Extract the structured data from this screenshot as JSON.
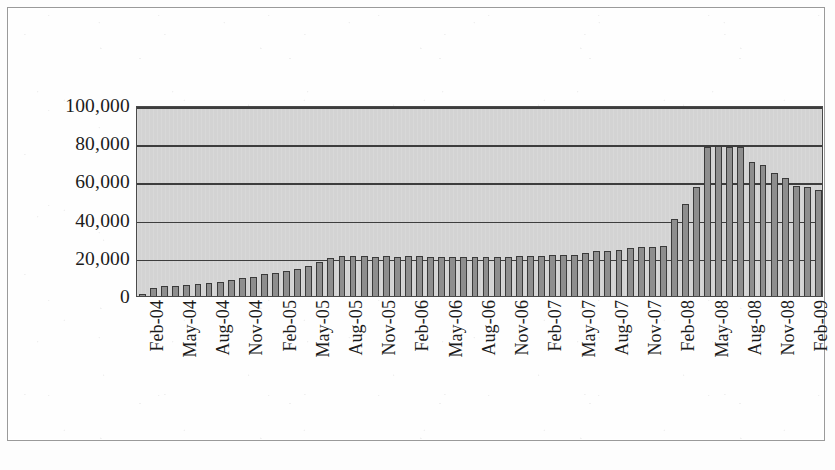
{
  "chart_data": {
    "type": "bar",
    "title": "",
    "subtitle": "",
    "xlabel": "",
    "ylabel": "",
    "ylim": [
      0,
      100000
    ],
    "ytick_labels": [
      "100,000",
      "80,000",
      "60,000",
      "40,000",
      "20,000",
      "0"
    ],
    "ytick_values": [
      100000,
      80000,
      60000,
      40000,
      20000,
      0
    ],
    "grid": true,
    "legend": "none",
    "xtick_labels": [
      "Feb-04",
      "May-04",
      "Aug-04",
      "Nov-04",
      "Feb-05",
      "May-05",
      "Aug-05",
      "Nov-05",
      "Feb-06",
      "May-06",
      "Aug-06",
      "Nov-06",
      "Feb-07",
      "May-07",
      "Aug-07",
      "Nov-07",
      "Feb-08",
      "May-08",
      "Aug-08",
      "Nov-08",
      "Feb-09"
    ],
    "xtick_indices": [
      0,
      3,
      6,
      9,
      12,
      15,
      18,
      21,
      24,
      27,
      30,
      33,
      36,
      39,
      42,
      45,
      48,
      51,
      54,
      57,
      60
    ],
    "categories": [
      "Feb-04",
      "Mar-04",
      "Apr-04",
      "May-04",
      "Jun-04",
      "Jul-04",
      "Aug-04",
      "Sep-04",
      "Oct-04",
      "Nov-04",
      "Dec-04",
      "Jan-05",
      "Feb-05",
      "Mar-05",
      "Apr-05",
      "May-05",
      "Jun-05",
      "Jul-05",
      "Aug-05",
      "Sep-05",
      "Oct-05",
      "Nov-05",
      "Dec-05",
      "Jan-06",
      "Feb-06",
      "Mar-06",
      "Apr-06",
      "May-06",
      "Jun-06",
      "Jul-06",
      "Aug-06",
      "Sep-06",
      "Oct-06",
      "Nov-06",
      "Dec-06",
      "Jan-07",
      "Feb-07",
      "Mar-07",
      "Apr-07",
      "May-07",
      "Jun-07",
      "Jul-07",
      "Aug-07",
      "Sep-07",
      "Oct-07",
      "Nov-07",
      "Dec-07",
      "Jan-08",
      "Feb-08",
      "Mar-08",
      "Apr-08",
      "May-08",
      "Jun-08",
      "Jul-08",
      "Aug-08",
      "Sep-08",
      "Oct-08",
      "Nov-08",
      "Dec-08",
      "Jan-09",
      "Feb-09",
      "Mar-09"
    ],
    "values": [
      1200,
      4200,
      5000,
      5200,
      6000,
      6200,
      7000,
      7200,
      8600,
      9600,
      10200,
      11600,
      12200,
      13000,
      14000,
      15600,
      17600,
      19800,
      20800,
      21000,
      21000,
      20600,
      20800,
      20600,
      21000,
      20800,
      20600,
      20600,
      20400,
      20400,
      20400,
      20600,
      20600,
      20600,
      20800,
      20800,
      21000,
      21600,
      21400,
      21600,
      22400,
      23400,
      23600,
      24200,
      25400,
      25600,
      25600,
      26000,
      40200,
      48000,
      57000,
      78000,
      78400,
      78200,
      78000,
      70400,
      68600,
      64200,
      61800,
      57400,
      57000,
      55600
    ],
    "bar_color": "#8e8e8e",
    "bar_edge_color": "#3a3a3a",
    "plot_background": "#d3d3d3",
    "gridline_color": "#3d3d3d",
    "axis_color": "#4a4a4a",
    "peak": {
      "label": "May-08",
      "value": 78000
    }
  },
  "caption": {
    "bleed_text": ""
  }
}
